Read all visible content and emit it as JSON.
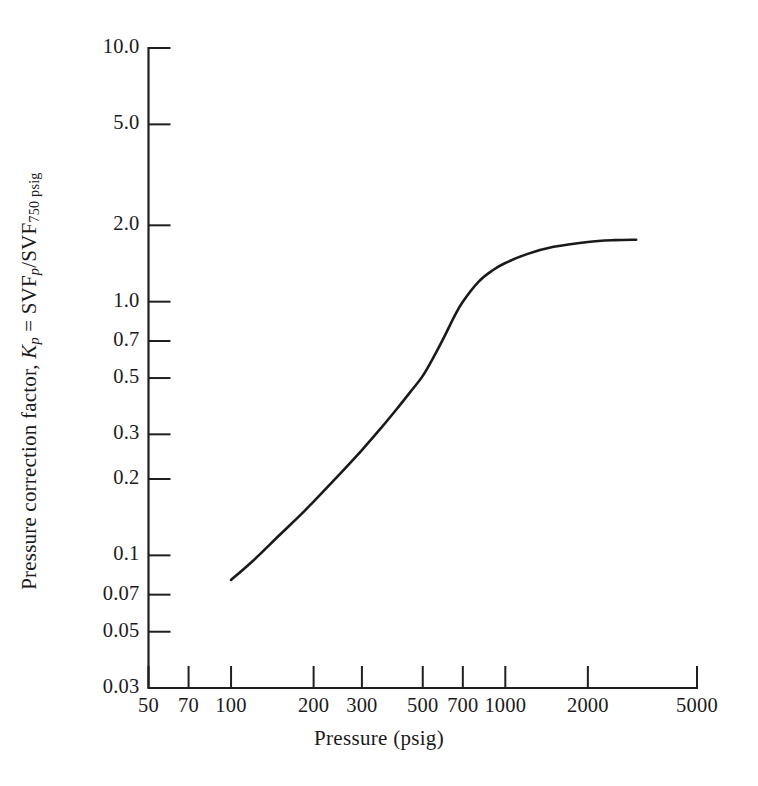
{
  "chart_data": {
    "type": "line",
    "title": "",
    "xlabel": "Pressure (psig)",
    "ylabel": "Pressure correction factor, Kp = SVFp/SVF750 psig",
    "ylabel_parts": {
      "prefix": "Pressure correction factor, ",
      "symbol": "K",
      "symbol_sub": "p",
      "equals": " = SVF",
      "num_sub": "p",
      "slash": "/SVF",
      "den_sub": "750 psig"
    },
    "xscale": "log",
    "yscale": "log",
    "xlim": [
      50,
      5000
    ],
    "ylim": [
      0.03,
      10.0
    ],
    "grid": false,
    "legend": null,
    "xticks": [
      50,
      70,
      100,
      200,
      300,
      500,
      700,
      1000,
      2000,
      5000
    ],
    "xtick_labels": [
      "50",
      "70",
      "100",
      "200",
      "300",
      "500",
      "700",
      "1000",
      "2000",
      "5000"
    ],
    "yticks": [
      0.03,
      0.05,
      0.07,
      0.1,
      0.2,
      0.3,
      0.5,
      0.7,
      1.0,
      2.0,
      5.0,
      10.0
    ],
    "ytick_labels": [
      "0.03",
      "0.05",
      "0.07",
      "0.1",
      "0.2",
      "0.3",
      "0.5",
      "0.7",
      "1.0",
      "2.0",
      "5.0",
      "10.0"
    ],
    "series": [
      {
        "name": "Pressure correction factor",
        "color": "#1a1a1a",
        "x": [
          100,
          120,
          150,
          180,
          200,
          250,
          300,
          350,
          400,
          450,
          500,
          550,
          600,
          650,
          700,
          800,
          900,
          1000,
          1200,
          1500,
          2000,
          2500,
          3000
        ],
        "y": [
          0.08,
          0.095,
          0.12,
          0.145,
          0.163,
          0.21,
          0.26,
          0.315,
          0.375,
          0.44,
          0.51,
          0.61,
          0.73,
          0.87,
          1.0,
          1.2,
          1.33,
          1.42,
          1.54,
          1.645,
          1.72,
          1.748,
          1.755
        ]
      }
    ]
  },
  "axis_title": {
    "x": "Pressure (psig)"
  }
}
